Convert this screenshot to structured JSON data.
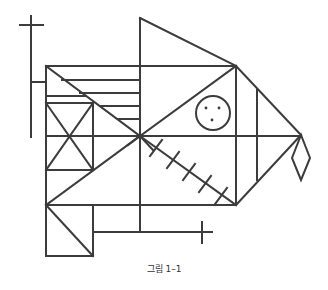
{
  "figure": {
    "caption": "그림 1–1",
    "stroke_color": "#3c3c3c",
    "elements": {
      "circle": {
        "cx": 213,
        "cy": 113,
        "r": 17,
        "dots": 3
      },
      "hatch_ticks": 5,
      "crosses": 2,
      "diamond": 1
    }
  }
}
